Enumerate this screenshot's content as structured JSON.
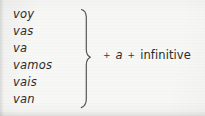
{
  "figure": {
    "background_color": "#f7f7f5",
    "text_color": "#2b2b2b"
  },
  "conjugation": {
    "verb": "ir",
    "items": [
      {
        "form": "voy"
      },
      {
        "form": "vas"
      },
      {
        "form": "va"
      },
      {
        "form": "vamos"
      },
      {
        "form": "vais"
      },
      {
        "form": "van"
      }
    ]
  },
  "brace": {
    "icon": "right-curly-brace-icon",
    "color": "#3a3a3a"
  },
  "formula": {
    "plus_first": "+",
    "preposition": "a",
    "plus_second": "+",
    "infinitive": "infinitive"
  },
  "ghost_text": {
    "line_1": "",
    "line_2": ""
  }
}
